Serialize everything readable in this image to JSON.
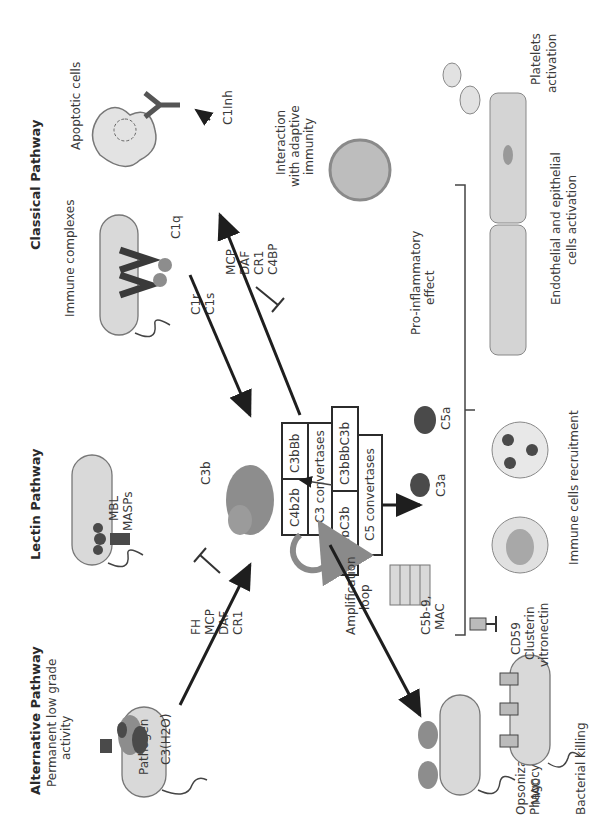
{
  "pathways": {
    "alternative": {
      "title": "Alternative Pathway",
      "subtitle_line1": "Permanent low grade",
      "subtitle_line2": "activity",
      "molecule": "C3(H2O)",
      "pathogen": "Pathogen"
    },
    "lectin": {
      "title": "Lectin Pathway",
      "molecule1": "MASPs",
      "molecule2": "MBL"
    },
    "classical": {
      "title": "Classical Pathway",
      "source1": "Immune complexes",
      "source2": "Apoptotic cells",
      "molecule1": "C1r",
      "molecule2": "C1s",
      "molecule3": "C1q",
      "inhibitor": "C1Inh"
    }
  },
  "regulators": {
    "alternative": [
      "FH",
      "MCP",
      "DAF",
      "CR1"
    ],
    "classical": [
      "MCP",
      "DAF",
      "CR1",
      "C4BP"
    ],
    "mac": [
      "CD59",
      "Clusterin",
      "vitronectin"
    ]
  },
  "center": {
    "c3b": "C3b",
    "c3_convertase_alt": "C3bBb",
    "c3_convertase_class": "C4b2b",
    "c3_label": "C3 convertases",
    "c5_convertase_alt": "C3bBbC3b",
    "c5_convertase_class": "C4b2bC3b",
    "c5_label": "C5 convertases",
    "amplification_line1": "Amplification",
    "amplification_line2": "loop",
    "mac_line1": "C5b-9,",
    "mac_line2": "MAC",
    "c3a": "C3a",
    "c5a": "C5a"
  },
  "outcomes": {
    "opsonization_line1": "Opsonization,",
    "opsonization_line2": "Phagocytosis",
    "mac": "MAC",
    "bacterial_killing": "Bacterial killing",
    "immune_recruitment": "Immune cells recruitment",
    "pro_inflammatory_line1": "Pro-inflammatory",
    "pro_inflammatory_line2": "effect",
    "endothelial_line1": "Endothelial and epithelial",
    "endothelial_line2": "cells activation",
    "platelets_line1": "Platelets",
    "platelets_line2": "activation",
    "adaptive_line1": "Interaction",
    "adaptive_line2": "with adaptive",
    "adaptive_line3": "immunity"
  }
}
